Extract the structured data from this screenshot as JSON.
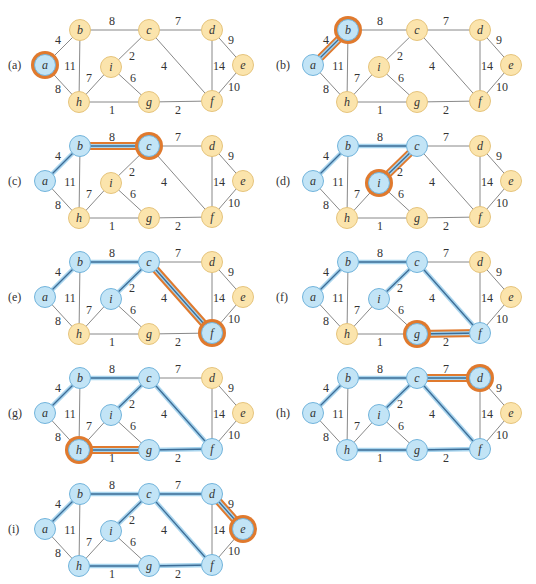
{
  "figure": {
    "colors": {
      "tree_node_fill": "#c2e4f6",
      "tree_node_stroke": "#72b4dc",
      "other_node_fill": "#fbe4ac",
      "other_node_stroke": "#e6c47c",
      "highlight_ring": "#e07a2e",
      "edge_normal": "#7a7a7a",
      "tree_edge_outer": "#a9d5ee",
      "tree_edge_inner": "#3c6c96",
      "highlight_edge_outer": "#e07a2e"
    },
    "nodes": [
      {
        "id": "a",
        "x": 45,
        "y": 65
      },
      {
        "id": "b",
        "x": 80,
        "y": 30
      },
      {
        "id": "c",
        "x": 149,
        "y": 30
      },
      {
        "id": "d",
        "x": 212,
        "y": 30
      },
      {
        "id": "e",
        "x": 243,
        "y": 65
      },
      {
        "id": "f",
        "x": 212,
        "y": 101
      },
      {
        "id": "g",
        "x": 149,
        "y": 102
      },
      {
        "id": "h",
        "x": 79,
        "y": 102
      },
      {
        "id": "i",
        "x": 111,
        "y": 67
      }
    ],
    "edges": [
      {
        "u": "a",
        "v": "b",
        "w": "4",
        "lx": 58,
        "ly": 44
      },
      {
        "u": "a",
        "v": "h",
        "w": "8",
        "lx": 58,
        "ly": 93
      },
      {
        "u": "b",
        "v": "c",
        "w": "8",
        "lx": 112,
        "ly": 25
      },
      {
        "u": "b",
        "v": "h",
        "w": "11",
        "lx": 70,
        "ly": 70
      },
      {
        "u": "c",
        "v": "d",
        "w": "7",
        "lx": 178,
        "ly": 25
      },
      {
        "u": "c",
        "v": "i",
        "w": "2",
        "lx": 132,
        "ly": 60
      },
      {
        "u": "c",
        "v": "f",
        "w": "4",
        "lx": 164,
        "ly": 70
      },
      {
        "u": "d",
        "v": "e",
        "w": "9",
        "lx": 231,
        "ly": 44
      },
      {
        "u": "d",
        "v": "f",
        "w": "14",
        "lx": 219,
        "ly": 70
      },
      {
        "u": "e",
        "v": "f",
        "w": "10",
        "lx": 234,
        "ly": 91
      },
      {
        "u": "f",
        "v": "g",
        "w": "2",
        "lx": 178,
        "ly": 114
      },
      {
        "u": "g",
        "v": "h",
        "w": "1",
        "lx": 112,
        "ly": 114
      },
      {
        "u": "h",
        "v": "i",
        "w": "7",
        "lx": 89,
        "ly": 82
      },
      {
        "u": "i",
        "v": "g",
        "w": "6",
        "lx": 133,
        "ly": 82
      }
    ],
    "panels": [
      {
        "label": "(a)",
        "ox": 0,
        "oy": 0,
        "tree_nodes": [
          "a"
        ],
        "tree_edges": [],
        "highlight_node": "a",
        "highlight_edge": null
      },
      {
        "label": "(b)",
        "ox": 268,
        "oy": 0,
        "tree_nodes": [
          "a",
          "b"
        ],
        "tree_edges": [],
        "highlight_node": "b",
        "highlight_edge": "a-b"
      },
      {
        "label": "(c)",
        "ox": 0,
        "oy": 116,
        "tree_nodes": [
          "a",
          "b",
          "c"
        ],
        "tree_edges": [
          "a-b"
        ],
        "highlight_node": "c",
        "highlight_edge": "b-c"
      },
      {
        "label": "(d)",
        "ox": 268,
        "oy": 116,
        "tree_nodes": [
          "a",
          "b",
          "c",
          "i"
        ],
        "tree_edges": [
          "a-b",
          "b-c"
        ],
        "highlight_node": "i",
        "highlight_edge": "c-i"
      },
      {
        "label": "(e)",
        "ox": 0,
        "oy": 232,
        "tree_nodes": [
          "a",
          "b",
          "c",
          "i",
          "f"
        ],
        "tree_edges": [
          "a-b",
          "b-c",
          "c-i"
        ],
        "highlight_node": "f",
        "highlight_edge": "c-f"
      },
      {
        "label": "(f)",
        "ox": 268,
        "oy": 232,
        "tree_nodes": [
          "a",
          "b",
          "c",
          "i",
          "f",
          "g"
        ],
        "tree_edges": [
          "a-b",
          "b-c",
          "c-i",
          "c-f"
        ],
        "highlight_node": "g",
        "highlight_edge": "f-g"
      },
      {
        "label": "(g)",
        "ox": 0,
        "oy": 348,
        "tree_nodes": [
          "a",
          "b",
          "c",
          "i",
          "f",
          "g",
          "h"
        ],
        "tree_edges": [
          "a-b",
          "b-c",
          "c-i",
          "c-f",
          "f-g"
        ],
        "highlight_node": "h",
        "highlight_edge": "g-h"
      },
      {
        "label": "(h)",
        "ox": 268,
        "oy": 348,
        "tree_nodes": [
          "a",
          "b",
          "c",
          "i",
          "f",
          "g",
          "h",
          "d"
        ],
        "tree_edges": [
          "a-b",
          "b-c",
          "c-i",
          "c-f",
          "f-g",
          "g-h"
        ],
        "highlight_node": "d",
        "highlight_edge": "c-d"
      },
      {
        "label": "(i)",
        "ox": 0,
        "oy": 464,
        "tree_nodes": [
          "a",
          "b",
          "c",
          "i",
          "f",
          "g",
          "h",
          "d",
          "e"
        ],
        "tree_edges": [
          "a-b",
          "b-c",
          "c-i",
          "c-f",
          "f-g",
          "g-h",
          "c-d"
        ],
        "highlight_node": "e",
        "highlight_edge": "d-e"
      }
    ]
  }
}
